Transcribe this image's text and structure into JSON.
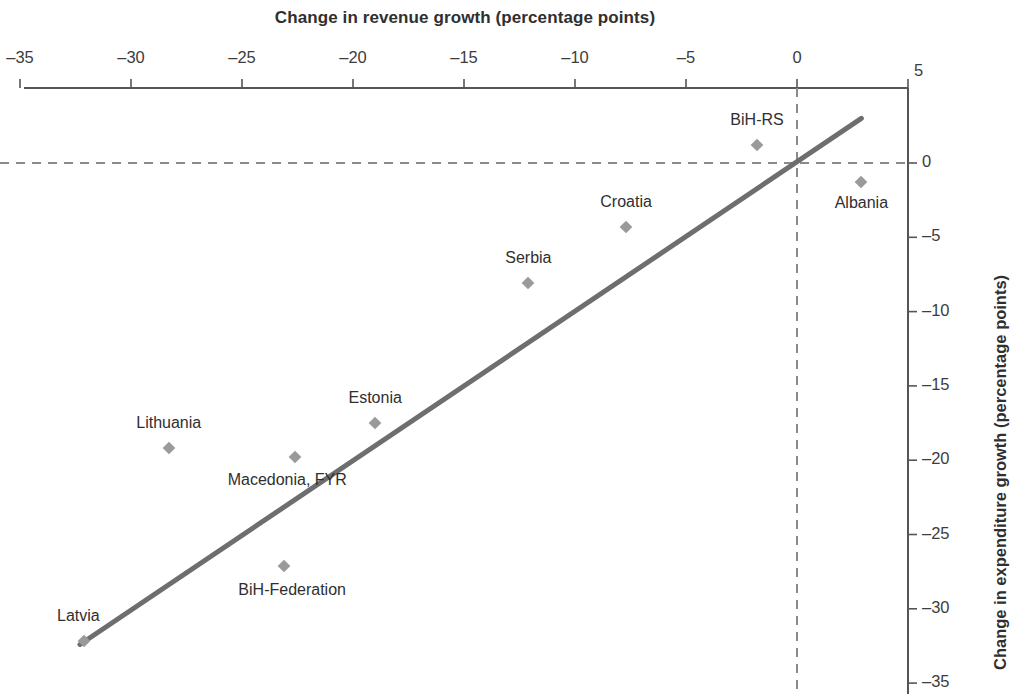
{
  "chart_data": {
    "type": "scatter",
    "title": "",
    "xlabel": "Change in revenue growth (percentage points)",
    "ylabel": "Change in expenditure growth (percentage points)",
    "xlim": [
      -35,
      5
    ],
    "ylim": [
      -35,
      3
    ],
    "x_ticks": [
      -35,
      -30,
      -25,
      -20,
      -15,
      -10,
      -5,
      0,
      5
    ],
    "x_tick_labels": [
      "–35",
      "–30",
      "–25",
      "–20",
      "–15",
      "–10",
      "–5",
      "0",
      "5"
    ],
    "y_ticks": [
      0,
      -5,
      -10,
      -15,
      -20,
      -25,
      -30,
      -35
    ],
    "y_tick_labels": [
      "0",
      "–5",
      "–10",
      "–15",
      "–20",
      "–25",
      "–30",
      "–35"
    ],
    "x_axis_position": "top",
    "y_axis_position": "right",
    "grid": false,
    "legend": "none",
    "reference_lines": [
      {
        "orientation": "horizontal",
        "value": 0,
        "style": "dashed"
      },
      {
        "orientation": "vertical",
        "value": 0,
        "style": "dashed"
      }
    ],
    "trendline": {
      "style": "solid",
      "color": "#6e6e6e",
      "x_start": -32.3,
      "y_start": -32.4,
      "x_end": 2.9,
      "y_end": 3.0
    },
    "marker_color": "#9a9a9a",
    "marker_shape": "diamond",
    "points": [
      {
        "label": "BiH-RS",
        "x": -1.8,
        "y": 1.2,
        "label_dx": 0,
        "label_dy": -24
      },
      {
        "label": "Albania",
        "x": 2.9,
        "y": -1.3,
        "label_dx": 0,
        "label_dy": 22
      },
      {
        "label": "Croatia",
        "x": -7.7,
        "y": -4.3,
        "label_dx": 0,
        "label_dy": -24
      },
      {
        "label": "Serbia",
        "x": -12.1,
        "y": -8.1,
        "label_dx": 0,
        "label_dy": -24
      },
      {
        "label": "Estonia",
        "x": -19.0,
        "y": -17.5,
        "label_dx": 0,
        "label_dy": -24
      },
      {
        "label": "Lithuania",
        "x": -28.3,
        "y": -19.2,
        "label_dx": 0,
        "label_dy": -24
      },
      {
        "label": "Macedonia, FYR",
        "x": -22.6,
        "y": -19.8,
        "label_dx": -8,
        "label_dy": 24
      },
      {
        "label": "BiH-Federation",
        "x": -23.1,
        "y": -27.1,
        "label_dx": 8,
        "label_dy": 25
      },
      {
        "label": "Latvia",
        "x": -32.1,
        "y": -32.2,
        "label_dx": -6,
        "label_dy": -24
      }
    ]
  },
  "colors": {
    "axis": "#555555",
    "marker": "#9a9a9a",
    "trendline": "#6e6e6e",
    "dash": "#8a8a8a",
    "text": "#3d3d3d"
  }
}
